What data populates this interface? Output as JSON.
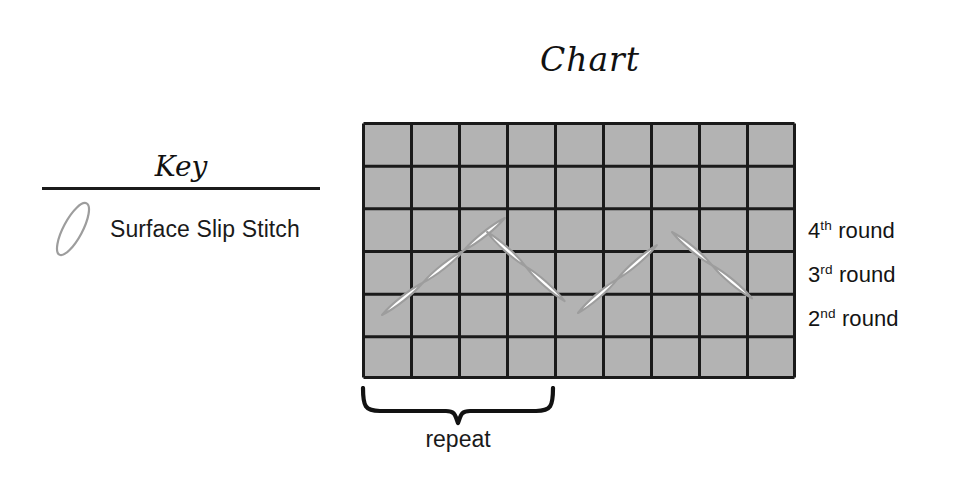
{
  "page": {
    "background": "#ffffff",
    "width": 972,
    "height": 486
  },
  "chart_title": "Chart",
  "key": {
    "heading": "Key",
    "entries": [
      {
        "symbol": "surface-slip-stitch-ellipse",
        "label": "Surface Slip Stitch"
      }
    ],
    "rule_color": "#1b1b1b"
  },
  "round_labels": [
    {
      "ordinal": "4",
      "suffix": "th",
      "text": "round"
    },
    {
      "ordinal": "3",
      "suffix": "rd",
      "text": "round"
    },
    {
      "ordinal": "2",
      "suffix": "nd",
      "text": "round"
    }
  ],
  "repeat": {
    "label": "repeat",
    "columns_spanned": 4
  },
  "chart_data": {
    "type": "diagram",
    "title": "Chart",
    "grid": {
      "columns": 9,
      "rows": 6,
      "cell_width": 48,
      "cell_height": 42.5,
      "cell_fill": "#b3b3b3",
      "line_color": "#1a1a1a",
      "line_width": 3
    },
    "stitch_symbol": {
      "name": "surface-slip-stitch",
      "shape": "pointed-lens",
      "fill": "#ffffff",
      "stroke": "#9a9a9a"
    },
    "stitch_path_points": [
      {
        "x": 20,
        "y": 193
      },
      {
        "x": 125,
        "y": 110
      },
      {
        "x": 216,
        "y": 191
      },
      {
        "x": 310,
        "y": 110
      },
      {
        "x": 410,
        "y": 193
      }
    ],
    "stitches_per_segment": 2,
    "row_annotations": [
      {
        "row_from_bottom": 4,
        "label": "4th round"
      },
      {
        "row_from_bottom": 3,
        "label": "3rd round"
      },
      {
        "row_from_bottom": 2,
        "label": "2nd round"
      }
    ]
  }
}
